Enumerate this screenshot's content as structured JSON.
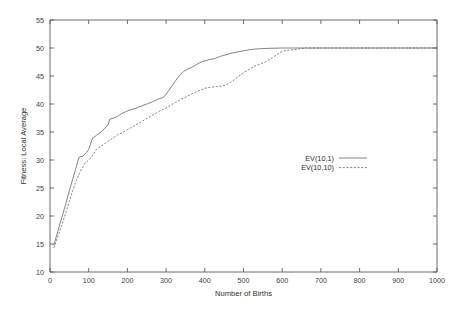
{
  "chart_data": {
    "type": "line",
    "title": "",
    "xlabel": "Number of Births",
    "ylabel": "Fitness: Local Average",
    "xlim": [
      0,
      1000
    ],
    "ylim": [
      10,
      55
    ],
    "xticks": [
      0,
      100,
      200,
      300,
      400,
      500,
      600,
      700,
      800,
      900,
      1000
    ],
    "xtick_labels": [
      "0",
      "100",
      "200",
      "300",
      "400",
      "500",
      "600",
      "700",
      "800",
      "900",
      "1000"
    ],
    "yticks": [
      10,
      15,
      20,
      25,
      30,
      35,
      40,
      45,
      50,
      55
    ],
    "ytick_labels": [
      "10",
      "15",
      "20",
      "25",
      "30",
      "35",
      "40",
      "45",
      "50",
      "55"
    ],
    "grid": false,
    "legend_position": "center-right-inside",
    "line_color": "#6e6e6e",
    "axis_color": "#5a5a5a",
    "series": [
      {
        "name": "EV(10,1)",
        "style": "solid",
        "x": [
          10,
          20,
          30,
          40,
          50,
          60,
          70,
          75,
          85,
          95,
          100,
          110,
          120,
          130,
          140,
          150,
          155,
          165,
          175,
          185,
          195,
          205,
          220,
          235,
          250,
          265,
          280,
          290,
          295,
          305,
          315,
          325,
          335,
          345,
          355,
          365,
          375,
          385,
          395,
          410,
          425,
          440,
          455,
          470,
          485,
          500,
          515,
          530,
          550,
          570,
          600,
          650,
          700,
          800,
          900,
          1000
        ],
        "y": [
          14.8,
          17.2,
          19.6,
          22.0,
          24.5,
          26.9,
          29.3,
          30.5,
          30.7,
          31.4,
          31.9,
          33.9,
          34.4,
          34.9,
          35.5,
          36.3,
          37.3,
          37.5,
          37.8,
          38.3,
          38.6,
          38.9,
          39.2,
          39.6,
          40.0,
          40.4,
          40.9,
          41.1,
          41.3,
          42.2,
          43.2,
          44.2,
          45.1,
          45.8,
          46.2,
          46.5,
          46.9,
          47.3,
          47.6,
          47.9,
          48.1,
          48.5,
          48.8,
          49.1,
          49.3,
          49.5,
          49.7,
          49.8,
          49.9,
          49.95,
          50.0,
          50.0,
          50.0,
          50.0,
          50.0,
          50.0
        ]
      },
      {
        "name": "EV(10,10)",
        "style": "dashed",
        "x": [
          10,
          20,
          30,
          40,
          50,
          60,
          70,
          80,
          90,
          100,
          110,
          120,
          130,
          145,
          160,
          175,
          190,
          200,
          215,
          230,
          245,
          260,
          275,
          285,
          295,
          310,
          325,
          340,
          355,
          370,
          385,
          400,
          415,
          430,
          445,
          455,
          470,
          485,
          500,
          515,
          530,
          545,
          560,
          575,
          590,
          600,
          615,
          630,
          645,
          660,
          700,
          800,
          900,
          1000
        ],
        "y": [
          14.3,
          16.3,
          18.3,
          20.4,
          22.6,
          24.8,
          26.7,
          28.2,
          29.4,
          30.0,
          30.8,
          31.9,
          32.4,
          33.1,
          33.8,
          34.5,
          35.0,
          35.4,
          36.0,
          36.6,
          37.2,
          37.8,
          38.4,
          38.8,
          39.1,
          39.7,
          40.3,
          40.9,
          41.4,
          41.9,
          42.4,
          42.8,
          43.0,
          43.1,
          43.2,
          43.4,
          44.0,
          44.8,
          45.6,
          46.2,
          46.8,
          47.2,
          47.6,
          48.3,
          49.0,
          49.4,
          49.6,
          49.7,
          49.85,
          50.0,
          50.0,
          50.0,
          50.0,
          50.0
        ]
      }
    ],
    "legend": [
      {
        "label": "EV(10,1)",
        "style": "solid"
      },
      {
        "label": "EV(10,10)",
        "style": "dashed"
      }
    ]
  }
}
